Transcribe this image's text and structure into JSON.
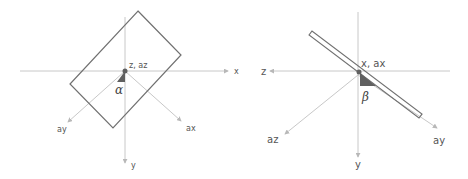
{
  "left_panel": {
    "labels": {
      "x": "x",
      "y": "y",
      "origin": "z, az",
      "ax": "ax",
      "ay": "ay",
      "angle": "α"
    }
  },
  "right_panel": {
    "labels": {
      "z": "z",
      "y": "y",
      "origin": "x, ax",
      "ay": "ay",
      "az": "az",
      "angle": "β"
    }
  },
  "colors": {
    "axis": "#c8c8c8",
    "shape": "#707070",
    "angle_fill": "#606060",
    "text": "#555555"
  }
}
